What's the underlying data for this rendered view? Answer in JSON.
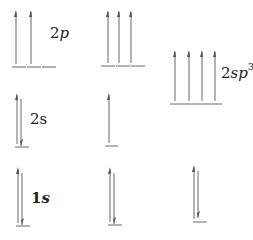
{
  "diagram": {
    "title": "",
    "columns": [
      {
        "name": "ground-state",
        "levels": [
          {
            "label_num": "2",
            "label_orb": "p",
            "orbitals": [
              "up",
              "up",
              "empty"
            ]
          },
          {
            "label_num": "2",
            "label_orb": "s",
            "orbitals": [
              "paired"
            ]
          },
          {
            "label_num": "1",
            "label_orb": "s",
            "orbitals": [
              "paired"
            ]
          }
        ]
      },
      {
        "name": "excited-state",
        "levels": [
          {
            "orbitals": [
              "up",
              "up",
              "up"
            ]
          },
          {
            "orbitals": [
              "up"
            ]
          },
          {
            "orbitals": [
              "paired"
            ]
          }
        ]
      },
      {
        "name": "sp3-hybridized",
        "levels": [
          {
            "label_num": "2",
            "label_orb": "sp",
            "label_sup": "3",
            "orbitals": [
              "up",
              "up",
              "up",
              "up"
            ]
          },
          {
            "orbitals": [
              "paired"
            ]
          }
        ]
      }
    ],
    "colors": {
      "line": "#8a8a8a",
      "text": "#222222"
    }
  }
}
